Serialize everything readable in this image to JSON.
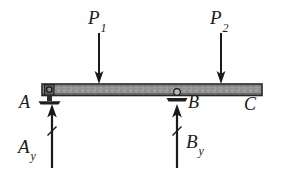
{
  "figure": {
    "width": 282,
    "height": 172,
    "background_color": "#ffffff",
    "ink_color": "#1a1a1a",
    "beam_fill_color": "#9a9a9a",
    "beam_edge_color": "#2b2b2b"
  },
  "beam": {
    "label": "beam",
    "x_left": 42,
    "x_right": 262,
    "y_top": 84,
    "y_bottom": 95
  },
  "points": [
    {
      "id": "A",
      "label": "A",
      "x": 49,
      "label_x": 19,
      "label_y": 93
    },
    {
      "id": "B",
      "label": "B",
      "x": 177,
      "label_x": 188,
      "label_y": 93
    },
    {
      "id": "C",
      "label": "C",
      "x": 262,
      "label_x": 244,
      "label_y": 95
    }
  ],
  "supports": [
    {
      "at": "A",
      "type": "pin-support",
      "x": 49,
      "y": 95
    },
    {
      "at": "B",
      "type": "roller-support",
      "x": 177,
      "y": 95
    }
  ],
  "applied_loads": [
    {
      "id": "P1",
      "base": "P",
      "subscript": "1",
      "direction": "down",
      "x": 99,
      "arrow_top_y": 33,
      "arrow_tip_y": 84,
      "label_x": 88,
      "label_y": 8
    },
    {
      "id": "P2",
      "base": "P",
      "subscript": "2",
      "direction": "down",
      "x": 221,
      "arrow_top_y": 33,
      "arrow_tip_y": 84,
      "label_x": 210,
      "label_y": 8
    }
  ],
  "reactions": [
    {
      "id": "Ay",
      "base": "A",
      "subscript": "y",
      "direction": "up",
      "x": 52,
      "arrow_tail_y": 168,
      "arrow_tip_y": 104,
      "label_x": 18,
      "label_y": 137
    },
    {
      "id": "By",
      "base": "B",
      "subscript": "y",
      "direction": "up",
      "x": 177,
      "arrow_tail_y": 168,
      "arrow_tip_y": 104,
      "label_x": 186,
      "label_y": 132
    }
  ]
}
